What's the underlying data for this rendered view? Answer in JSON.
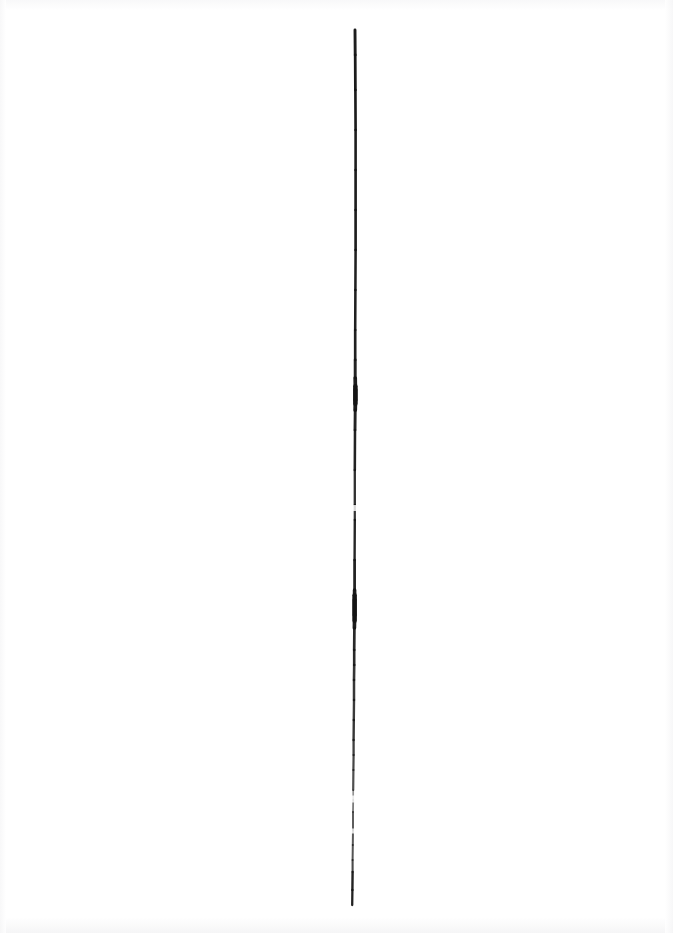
{
  "artwork": {
    "title": "Scanned vertical ink line",
    "medium": "ink on white paper (scan)",
    "canvas": {
      "width_px": 673,
      "height_px": 933,
      "background_color": "#ffffff"
    },
    "stroke": {
      "name": "vertical-ink-stroke",
      "color": "#141414",
      "orientation": "vertical",
      "top_y_px": 30,
      "bottom_y_px": 905,
      "length_px": 875,
      "average_width_px": 2.6,
      "min_width_px": 1.2,
      "max_width_px": 4.4,
      "horizontal_drift_px": 4,
      "x_at_top_px": 355,
      "x_at_bottom_px": 352,
      "description": "A single nearly straight hand-drawn vertical line running almost the full height of the page, slightly left of center, with uneven ink density, a few thickened blobs and several faint breaks toward the lower third."
    },
    "path_points": [
      {
        "y": 30,
        "x": 355.0,
        "w": 3.0,
        "opacity": 0.96
      },
      {
        "y": 55,
        "x": 355.2,
        "w": 2.8,
        "opacity": 0.97
      },
      {
        "y": 90,
        "x": 355.4,
        "w": 2.7,
        "opacity": 0.98
      },
      {
        "y": 130,
        "x": 355.6,
        "w": 2.6,
        "opacity": 0.97
      },
      {
        "y": 170,
        "x": 355.6,
        "w": 2.6,
        "opacity": 0.96
      },
      {
        "y": 210,
        "x": 355.6,
        "w": 2.7,
        "opacity": 0.97
      },
      {
        "y": 250,
        "x": 355.6,
        "w": 2.6,
        "opacity": 0.96
      },
      {
        "y": 290,
        "x": 355.4,
        "w": 2.5,
        "opacity": 0.95
      },
      {
        "y": 330,
        "x": 355.2,
        "w": 2.6,
        "opacity": 0.96
      },
      {
        "y": 360,
        "x": 355.2,
        "w": 2.7,
        "opacity": 0.95
      },
      {
        "y": 378,
        "x": 355.2,
        "w": 3.2,
        "opacity": 0.93
      },
      {
        "y": 390,
        "x": 355.4,
        "w": 4.2,
        "opacity": 0.99
      },
      {
        "y": 400,
        "x": 355.4,
        "w": 4.4,
        "opacity": 0.99
      },
      {
        "y": 410,
        "x": 355.2,
        "w": 3.2,
        "opacity": 0.95
      },
      {
        "y": 430,
        "x": 355.0,
        "w": 2.6,
        "opacity": 0.94
      },
      {
        "y": 470,
        "x": 354.8,
        "w": 2.5,
        "opacity": 0.93
      },
      {
        "y": 505,
        "x": 354.8,
        "w": 2.2,
        "opacity": 0.82
      },
      {
        "y": 520,
        "x": 354.8,
        "w": 2.3,
        "opacity": 0.9
      },
      {
        "y": 560,
        "x": 354.6,
        "w": 2.5,
        "opacity": 0.93
      },
      {
        "y": 590,
        "x": 354.6,
        "w": 3.0,
        "opacity": 0.95
      },
      {
        "y": 600,
        "x": 354.6,
        "w": 4.2,
        "opacity": 0.99
      },
      {
        "y": 615,
        "x": 354.6,
        "w": 4.3,
        "opacity": 0.99
      },
      {
        "y": 628,
        "x": 354.4,
        "w": 3.0,
        "opacity": 0.94
      },
      {
        "y": 650,
        "x": 354.2,
        "w": 2.4,
        "opacity": 0.88
      },
      {
        "y": 665,
        "x": 354.2,
        "w": 2.8,
        "opacity": 0.93
      },
      {
        "y": 680,
        "x": 354.0,
        "w": 2.4,
        "opacity": 0.8
      },
      {
        "y": 700,
        "x": 354.0,
        "w": 2.6,
        "opacity": 0.9
      },
      {
        "y": 720,
        "x": 353.8,
        "w": 2.2,
        "opacity": 0.78
      },
      {
        "y": 740,
        "x": 353.6,
        "w": 2.6,
        "opacity": 0.92
      },
      {
        "y": 755,
        "x": 353.6,
        "w": 2.0,
        "opacity": 0.7
      },
      {
        "y": 770,
        "x": 353.4,
        "w": 2.4,
        "opacity": 0.88
      },
      {
        "y": 790,
        "x": 353.2,
        "w": 2.0,
        "opacity": 0.62
      },
      {
        "y": 800,
        "x": 353.2,
        "w": 1.4,
        "opacity": 0.3
      },
      {
        "y": 812,
        "x": 353.0,
        "w": 2.2,
        "opacity": 0.82
      },
      {
        "y": 830,
        "x": 353.0,
        "w": 1.8,
        "opacity": 0.55
      },
      {
        "y": 845,
        "x": 352.8,
        "w": 2.2,
        "opacity": 0.84
      },
      {
        "y": 860,
        "x": 352.6,
        "w": 1.8,
        "opacity": 0.6
      },
      {
        "y": 872,
        "x": 352.6,
        "w": 2.4,
        "opacity": 0.92
      },
      {
        "y": 890,
        "x": 352.4,
        "w": 2.4,
        "opacity": 0.95
      },
      {
        "y": 905,
        "x": 352.2,
        "w": 2.2,
        "opacity": 0.93
      }
    ],
    "ink_blobs": [
      {
        "name": "blob-upper",
        "x": 355.4,
        "y": 395,
        "w": 4.4,
        "h": 22,
        "opacity": 1.0
      },
      {
        "name": "blob-lower",
        "x": 354.6,
        "y": 608,
        "w": 4.4,
        "h": 30,
        "opacity": 1.0
      }
    ],
    "breaks": [
      {
        "name": "break-mid",
        "x": 354.8,
        "y": 508,
        "h": 6
      },
      {
        "name": "break-low",
        "x": 353.2,
        "y": 799,
        "h": 7
      },
      {
        "name": "break-lower",
        "x": 353.0,
        "y": 831,
        "h": 5
      }
    ]
  }
}
